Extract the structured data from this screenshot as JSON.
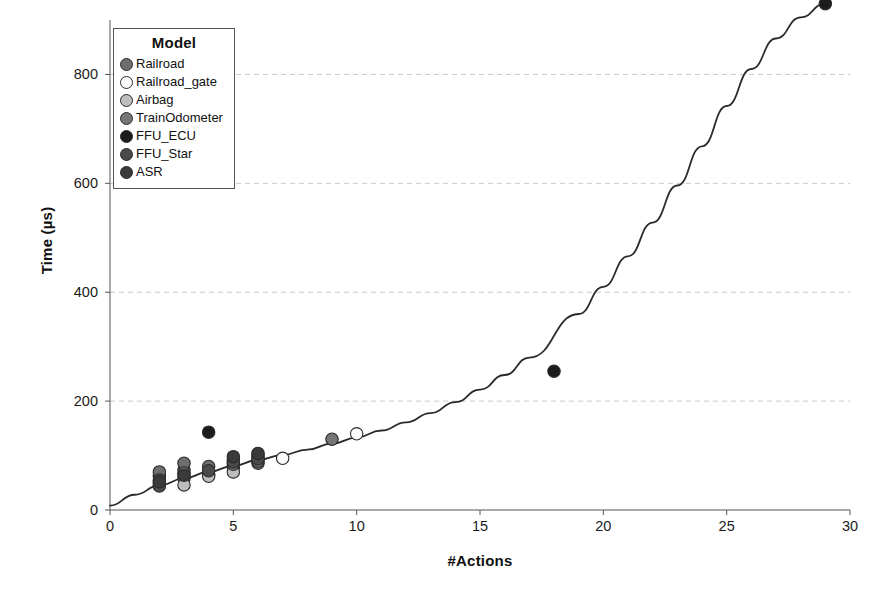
{
  "chart_data": {
    "type": "scatter",
    "title": "",
    "xlabel": "#Actions",
    "ylabel": "Time (µs)",
    "xlim": [
      0,
      30
    ],
    "ylim": [
      0,
      900
    ],
    "xticks": [
      0,
      5,
      10,
      15,
      20,
      25,
      30
    ],
    "yticks": [
      0,
      200,
      400,
      600,
      800
    ],
    "grid": "horizontal-dashed",
    "legend": {
      "title": "Model",
      "position": "top-left-inside",
      "entries": [
        {
          "label": "Railroad",
          "color": "#6e6e6e"
        },
        {
          "label": "Railroad_gate",
          "color": "#fbfbfb"
        },
        {
          "label": "Airbag",
          "color": "#bdbdbd"
        },
        {
          "label": "TrainOdometer",
          "color": "#767676"
        },
        {
          "label": "FFU_ECU",
          "color": "#1c1c1c"
        },
        {
          "label": "FFU_Star",
          "color": "#4a4a4a"
        },
        {
          "label": "ASR",
          "color": "#3a3a3a"
        }
      ]
    },
    "series": [
      {
        "name": "Railroad",
        "color": "#6e6e6e",
        "points": [
          {
            "x": 2,
            "y": 48
          },
          {
            "x": 2,
            "y": 62
          },
          {
            "x": 2,
            "y": 70
          },
          {
            "x": 3,
            "y": 58
          },
          {
            "x": 3,
            "y": 74
          },
          {
            "x": 3,
            "y": 86
          },
          {
            "x": 4,
            "y": 66
          },
          {
            "x": 4,
            "y": 80
          },
          {
            "x": 5,
            "y": 78
          },
          {
            "x": 5,
            "y": 92
          },
          {
            "x": 6,
            "y": 86
          },
          {
            "x": 6,
            "y": 96
          }
        ]
      },
      {
        "name": "Railroad_gate",
        "color": "#fbfbfb",
        "points": [
          {
            "x": 7,
            "y": 95
          },
          {
            "x": 10,
            "y": 140
          },
          {
            "x": 6,
            "y": 100
          }
        ]
      },
      {
        "name": "Airbag",
        "color": "#bdbdbd",
        "points": [
          {
            "x": 3,
            "y": 46
          },
          {
            "x": 5,
            "y": 70
          },
          {
            "x": 4,
            "y": 62
          }
        ]
      },
      {
        "name": "TrainOdometer",
        "color": "#767676",
        "points": [
          {
            "x": 2,
            "y": 55
          },
          {
            "x": 3,
            "y": 68
          },
          {
            "x": 5,
            "y": 84
          },
          {
            "x": 6,
            "y": 90
          },
          {
            "x": 9,
            "y": 130
          }
        ]
      },
      {
        "name": "FFU_ECU",
        "color": "#1c1c1c",
        "points": [
          {
            "x": 4,
            "y": 143
          },
          {
            "x": 18,
            "y": 255
          },
          {
            "x": 29,
            "y": 930
          }
        ]
      },
      {
        "name": "FFU_Star",
        "color": "#4a4a4a",
        "points": [
          {
            "x": 2,
            "y": 44
          },
          {
            "x": 4,
            "y": 72
          },
          {
            "x": 5,
            "y": 88
          },
          {
            "x": 6,
            "y": 94
          }
        ]
      },
      {
        "name": "ASR",
        "color": "#3a3a3a",
        "points": [
          {
            "x": 2,
            "y": 52
          },
          {
            "x": 3,
            "y": 64
          },
          {
            "x": 5,
            "y": 98
          },
          {
            "x": 6,
            "y": 104
          }
        ]
      }
    ],
    "fit_curve": {
      "name": "fitted exponential trend",
      "color": "#2b2b2b",
      "points": [
        {
          "x": 0,
          "y": 8
        },
        {
          "x": 1,
          "y": 28
        },
        {
          "x": 2,
          "y": 45
        },
        {
          "x": 3,
          "y": 58
        },
        {
          "x": 4,
          "y": 70
        },
        {
          "x": 5,
          "y": 81
        },
        {
          "x": 6,
          "y": 92
        },
        {
          "x": 7,
          "y": 101
        },
        {
          "x": 8,
          "y": 111
        },
        {
          "x": 9,
          "y": 122
        },
        {
          "x": 10,
          "y": 133
        },
        {
          "x": 11,
          "y": 146
        },
        {
          "x": 12,
          "y": 161
        },
        {
          "x": 13,
          "y": 178
        },
        {
          "x": 14,
          "y": 198
        },
        {
          "x": 15,
          "y": 221
        },
        {
          "x": 16,
          "y": 248
        },
        {
          "x": 17,
          "y": 280
        },
        {
          "x": 18,
          "y": 255
        },
        {
          "x": 19,
          "y": 360
        },
        {
          "x": 20,
          "y": 410
        },
        {
          "x": 21,
          "y": 466
        },
        {
          "x": 22,
          "y": 528
        },
        {
          "x": 23,
          "y": 596
        },
        {
          "x": 24,
          "y": 668
        },
        {
          "x": 25,
          "y": 742
        },
        {
          "x": 26,
          "y": 810
        },
        {
          "x": 27,
          "y": 866
        },
        {
          "x": 28,
          "y": 905
        },
        {
          "x": 29,
          "y": 930
        }
      ]
    }
  }
}
